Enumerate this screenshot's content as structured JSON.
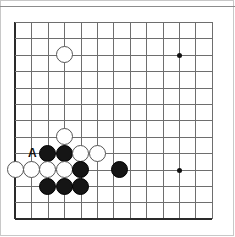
{
  "figure": {
    "kind": "go-board-diagram",
    "width": 235,
    "height": 237,
    "background_color": "#ffffff",
    "top_rule_color": "#8c8c8c"
  },
  "board": {
    "grid_color": "#6e6e6e",
    "edge_color": "#2a2a2a",
    "columns": 13,
    "rows": 13,
    "origin_x": 15,
    "origin_y": 22,
    "spacing": 16.4,
    "thick_edges": [
      "left",
      "bottom"
    ],
    "star_point_color": "#111111",
    "star_points": [
      {
        "name": "star-point-upper-right",
        "col": 10,
        "row": 2
      },
      {
        "name": "star-point-lower-right",
        "col": 10,
        "row": 9
      }
    ]
  },
  "stones": [
    {
      "name": "white-stone-c3-upper",
      "color": "white",
      "col": 3,
      "row": 2
    },
    {
      "name": "white-stone-c3-middle",
      "color": "white",
      "col": 3,
      "row": 7
    },
    {
      "name": "black-stone-c2-r8",
      "color": "black",
      "col": 2,
      "row": 8
    },
    {
      "name": "black-stone-c3-r8",
      "color": "black",
      "col": 3,
      "row": 8
    },
    {
      "name": "white-stone-c4-r8",
      "color": "white",
      "col": 4,
      "row": 8
    },
    {
      "name": "white-stone-c5-r8",
      "color": "white",
      "col": 5,
      "row": 8
    },
    {
      "name": "white-stone-c0-r9",
      "color": "white",
      "col": 0,
      "row": 9
    },
    {
      "name": "white-stone-c1-r9",
      "color": "white",
      "col": 1,
      "row": 9
    },
    {
      "name": "white-stone-c2-r9",
      "color": "white",
      "col": 2,
      "row": 9
    },
    {
      "name": "white-stone-c3-r9",
      "color": "white",
      "col": 3,
      "row": 9
    },
    {
      "name": "black-stone-c4-r9",
      "color": "black",
      "col": 4,
      "row": 9
    },
    {
      "name": "black-stone-c64-r9",
      "color": "black",
      "col": 6.4,
      "row": 9
    },
    {
      "name": "black-stone-c2-r10",
      "color": "black",
      "col": 2,
      "row": 10
    },
    {
      "name": "black-stone-c3-r10",
      "color": "black",
      "col": 3,
      "row": 10
    },
    {
      "name": "black-stone-c4-r10",
      "color": "black",
      "col": 4,
      "row": 10
    }
  ],
  "labels": [
    {
      "name": "board-label-a",
      "text": "A",
      "col": 1.05,
      "row": 8
    }
  ]
}
